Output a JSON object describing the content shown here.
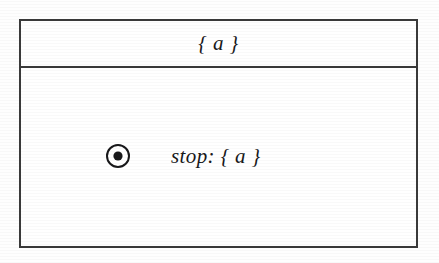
{
  "diagram": {
    "kind": "uml-state-diagram",
    "colors": {
      "page_background": "#fefefe",
      "box_background": "#ffffff",
      "border": "#3a3a3a",
      "text": "#18181a",
      "icon_stroke": "#18181a",
      "icon_fill": "#18181a"
    },
    "state_box": {
      "name_compartment": {
        "label": "{ a }"
      },
      "body_compartment": {
        "rows": [
          {
            "icon": "final-state-icon",
            "label": "stop: { a }"
          }
        ]
      }
    }
  }
}
